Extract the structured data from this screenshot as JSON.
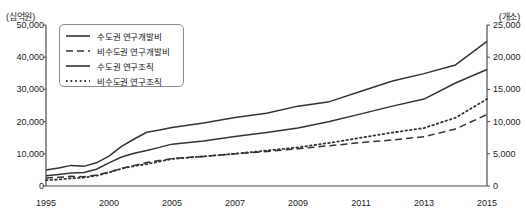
{
  "chart_data": {
    "type": "line",
    "title": "",
    "xlabel": "",
    "ylabel_left": "(십억원)",
    "ylabel_right": "(개소)",
    "grid": false,
    "legend_position": "top-left",
    "x": [
      1995,
      1996,
      1997,
      1998,
      1999,
      2000,
      2001,
      2002,
      2003,
      2004,
      2005,
      2006,
      2007,
      2008,
      2009,
      2010,
      2011,
      2012,
      2013,
      2014,
      2015
    ],
    "xticklabels": [
      "1995",
      "2000",
      "2005",
      "2007",
      "2009",
      "2011",
      "2013",
      "2015"
    ],
    "xtickvalues": [
      1995,
      2000,
      2005,
      2007,
      2009,
      2011,
      2013,
      2015
    ],
    "ylim_left": [
      0,
      50000
    ],
    "yticks_left": [
      0,
      10000,
      20000,
      30000,
      40000,
      50000
    ],
    "yticklabels_left": [
      "0",
      "10,000",
      "20,000",
      "30,000",
      "40,000",
      "50,000"
    ],
    "ylim_right": [
      0,
      25000
    ],
    "yticks_right": [
      0,
      5000,
      10000,
      15000,
      20000,
      25000
    ],
    "yticklabels_right": [
      "0",
      "5,000",
      "10,000",
      "15,000",
      "20,000",
      "25,000"
    ],
    "series": [
      {
        "name": "수도권 연구개발비",
        "axis": "left",
        "style": "solid",
        "color": "#333333",
        "values": [
          5000,
          5600,
          6400,
          6100,
          7200,
          9300,
          12300,
          14600,
          16700,
          17400,
          18200,
          19600,
          21300,
          22600,
          24800,
          26200,
          29400,
          32600,
          34900,
          37600,
          44900
        ]
      },
      {
        "name": "비수도권 연구개발비",
        "axis": "left",
        "style": "dashed",
        "color": "#333333",
        "values": [
          2500,
          2700,
          3000,
          2900,
          3400,
          4300,
          5500,
          6400,
          7300,
          7900,
          8500,
          9200,
          10000,
          10700,
          11600,
          12500,
          13500,
          14300,
          15300,
          17700,
          22200
        ]
      },
      {
        "name": "수도권 연구조직",
        "axis": "right",
        "style": "solid",
        "color": "#333333",
        "values": [
          1600,
          1800,
          2000,
          2100,
          2600,
          3600,
          4500,
          5100,
          5500,
          6000,
          6500,
          7000,
          7700,
          8300,
          9000,
          10000,
          11200,
          12400,
          13500,
          16000,
          18100
        ]
      },
      {
        "name": "비수도권 연구조직",
        "axis": "right",
        "style": "dotted",
        "color": "#333333",
        "values": [
          900,
          1000,
          1200,
          1300,
          1600,
          2100,
          2700,
          3100,
          3400,
          3800,
          4200,
          4600,
          5000,
          5500,
          6000,
          6700,
          7500,
          8300,
          9000,
          10600,
          13500
        ]
      }
    ]
  },
  "legend": {
    "items": [
      {
        "label": "수도권 연구개발비",
        "style": "solid"
      },
      {
        "label": "비수도권 연구개발비",
        "style": "dashed"
      },
      {
        "label": "수도권 연구조직",
        "style": "solid"
      },
      {
        "label": "비수도권 연구조직",
        "style": "dotted"
      }
    ]
  },
  "axes": {
    "left_unit": "(십억원)",
    "right_unit": "(개소)"
  }
}
